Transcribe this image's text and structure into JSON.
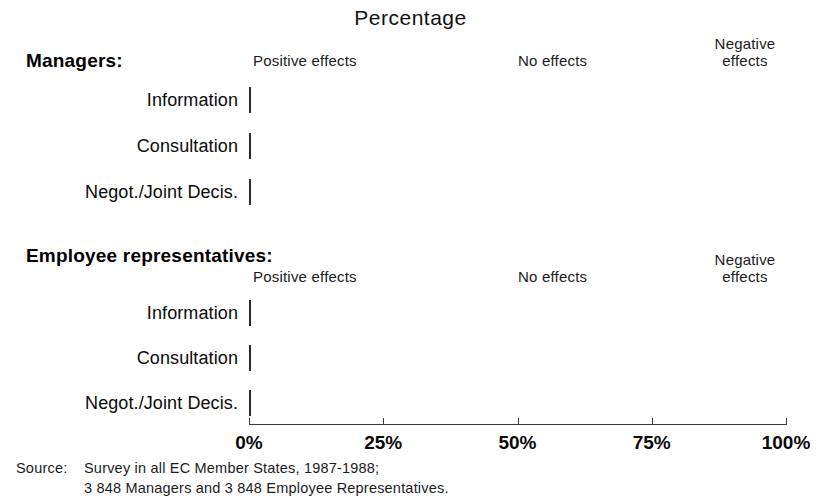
{
  "title": "Percentage",
  "groups": [
    {
      "heading": "Managers:",
      "legend": {
        "positive": "Positive effects",
        "no": "No effects",
        "negative_line1": "Negative",
        "negative_line2": "effects"
      },
      "rows": [
        {
          "label": "Information",
          "positive": 31,
          "no": 66,
          "negative": 3
        },
        {
          "label": "Consultation",
          "positive": 38,
          "no": 59,
          "negative": 3
        },
        {
          "label": "Negot./Joint Decis.",
          "positive": 45,
          "no": 52,
          "negative": 3
        }
      ]
    },
    {
      "heading": "Employee representatives:",
      "legend": {
        "positive": "Positive effects",
        "no": "No effects",
        "negative_line1": "Negative",
        "negative_line2": "effects"
      },
      "rows": [
        {
          "label": "Information",
          "positive": 26,
          "no": 68,
          "negative": 6
        },
        {
          "label": "Consultation",
          "positive": 40,
          "no": 52.5,
          "negative": 7.5
        },
        {
          "label": "Negot./Joint Decis.",
          "positive": 42,
          "no": 50,
          "negative": 8
        }
      ]
    }
  ],
  "axis": {
    "ticks": [
      0,
      25,
      50,
      75,
      100
    ],
    "tick_labels": [
      "0%",
      "25%",
      "50%",
      "75%",
      "100%"
    ],
    "min": 0,
    "max": 100
  },
  "source": {
    "word": "Source:",
    "line1": "Survey in all EC Member States, 1987-1988;",
    "line2": "3 848 Managers and 3 848 Employee Representatives."
  },
  "colors": {
    "positive": "#2e2e2e",
    "no_effects": "#fdfdfd",
    "negative": "#0a0a0a",
    "outline": "#2a2a2a"
  },
  "chart_data": {
    "type": "bar",
    "orientation": "horizontal",
    "stacked": true,
    "stacked_normalized": true,
    "title": "Percentage",
    "xlabel": "Percentage",
    "ylabel": "",
    "xlim": [
      0,
      100
    ],
    "xticks": [
      0,
      25,
      50,
      75,
      100
    ],
    "xticklabels": [
      "0%",
      "25%",
      "50%",
      "75%",
      "100%"
    ],
    "grid": false,
    "legend": [
      "Positive effects",
      "No effects",
      "Negative effects"
    ],
    "legend_position": "top",
    "panels": [
      {
        "name": "Managers",
        "categories": [
          "Information",
          "Consultation",
          "Negot./Joint Decis."
        ],
        "series": [
          {
            "name": "Positive effects",
            "values": [
              31,
              38,
              45
            ]
          },
          {
            "name": "No effects",
            "values": [
              66,
              59,
              52
            ]
          },
          {
            "name": "Negative effects",
            "values": [
              3,
              3,
              3
            ]
          }
        ]
      },
      {
        "name": "Employee representatives",
        "categories": [
          "Information",
          "Consultation",
          "Negot./Joint Decis."
        ],
        "series": [
          {
            "name": "Positive effects",
            "values": [
              26,
              40,
              42
            ]
          },
          {
            "name": "No effects",
            "values": [
              68,
              52.5,
              50
            ]
          },
          {
            "name": "Negative effects",
            "values": [
              6,
              7.5,
              8
            ]
          }
        ]
      }
    ],
    "annotations": [
      "Source: Survey in all EC Member States, 1987-1988;",
      "3 848 Managers and 3 848 Employee Representatives."
    ]
  }
}
